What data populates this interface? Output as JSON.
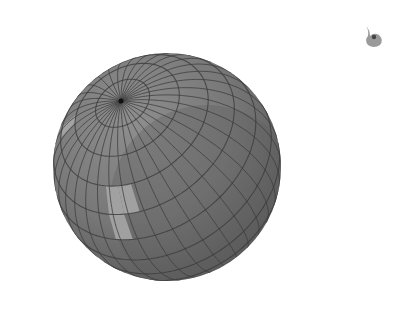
{
  "scene": {
    "subject": "3D sphere with latitude/longitude mesh",
    "sphere": {
      "center_x": 167,
      "center_y": 167,
      "radius": 114,
      "pole_x": 121,
      "pole_y": 101,
      "base_color": "#7c7c7c",
      "shadow_color": "#5e5e5e",
      "highlight_color": "#a9a9a9",
      "grid_color": "#3c3c3c"
    },
    "corner_icon": {
      "name": "paint-blob-icon",
      "x": 372,
      "y": 33,
      "color": "#8a8a8a"
    }
  }
}
